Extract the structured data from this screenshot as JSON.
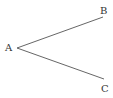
{
  "diagram": {
    "type": "angle",
    "stroke_color": "#555555",
    "text_color": "#333333",
    "vertex": {
      "label": "A",
      "x": 17,
      "y": 48
    },
    "rays": [
      {
        "label": "B",
        "x": 103,
        "y": 17
      },
      {
        "label": "C",
        "x": 104,
        "y": 79
      }
    ]
  }
}
